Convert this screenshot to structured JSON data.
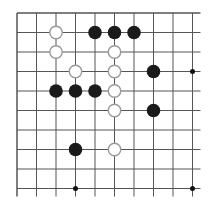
{
  "board": {
    "origin": {
      "x": 17,
      "y": 13
    },
    "spacing": 19.5,
    "cols_visible": 10,
    "rows_visible": 10,
    "edges": {
      "top": true,
      "left": true,
      "right": false,
      "bottom": false
    },
    "line_color": "#555555",
    "star_points": [
      [
        9,
        3
      ],
      [
        3,
        9
      ],
      [
        9,
        9
      ]
    ]
  },
  "stones": [
    {
      "color": "white",
      "col": 2,
      "row": 1
    },
    {
      "color": "black",
      "col": 4,
      "row": 1
    },
    {
      "color": "black",
      "col": 5,
      "row": 1
    },
    {
      "color": "black",
      "col": 6,
      "row": 1
    },
    {
      "color": "white",
      "col": 2,
      "row": 2
    },
    {
      "color": "white",
      "col": 5,
      "row": 2
    },
    {
      "color": "white",
      "col": 3,
      "row": 3
    },
    {
      "color": "white",
      "col": 5,
      "row": 3
    },
    {
      "color": "black",
      "col": 7,
      "row": 3
    },
    {
      "color": "black",
      "col": 2,
      "row": 4
    },
    {
      "color": "black",
      "col": 3,
      "row": 4
    },
    {
      "color": "black",
      "col": 4,
      "row": 4
    },
    {
      "color": "white",
      "col": 5,
      "row": 4
    },
    {
      "color": "white",
      "col": 5,
      "row": 5
    },
    {
      "color": "black",
      "col": 7,
      "row": 5
    },
    {
      "color": "black",
      "col": 3,
      "row": 7
    },
    {
      "color": "white",
      "col": 5,
      "row": 7
    }
  ],
  "colors": {
    "black_stone": "#1a1a1a",
    "white_stone_fill": "#ffffff",
    "white_stone_border": "#999999",
    "star_point": "#111111"
  }
}
